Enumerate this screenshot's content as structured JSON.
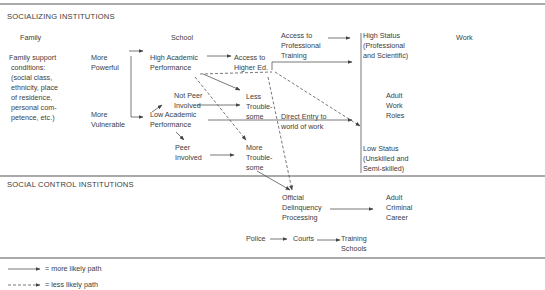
{
  "sections": {
    "socializing": "SOCIALIZING INSTITUTIONS",
    "social_control": "SOCIAL CONTROL INSTITUTIONS"
  },
  "columns": {
    "family": "Family",
    "school": "School",
    "work": "Work"
  },
  "nodes": {
    "family_support": "Family support\n conditions:\n (social class,\n ethnicity, place\n of residence,\n personal com-\n petence, etc.)",
    "more_powerful": "More\nPowerful",
    "more_vulnerable": "More\nVulnerable",
    "high_academic": "High Academic\nPerformance",
    "low_academic": "Low Academic\nPerformance",
    "not_peer_involved": "Not Peer\nInvolved",
    "peer_involved": "Peer\nInvolved",
    "access_higher_ed": "Access to\nHigher Ed.",
    "access_professional": "Access to\nProfessional\nTraining",
    "less_troublesome": "Less\nTrouble-\nsome",
    "more_troublesome": "More\nTrouble-\nsome",
    "direct_entry": "Direct Entry to\nworld of work",
    "high_status": "High Status\n(Professional\nand Scientific)",
    "adult_work_roles": "Adult\nWork\nRoles",
    "low_status": "Low Status\n(Unskilled and\nSemi-skilled)",
    "official_delinquency": "Official\nDelinquency\nProcessing",
    "adult_criminal": "Adult\nCriminal\nCareer",
    "police": "Police",
    "courts": "Courts",
    "training_schools": "Training\nSchools"
  },
  "legend": {
    "solid": "= more likely path",
    "dashed": "= less likely path"
  },
  "colors": {
    "line": "#444444",
    "text": "#3c3c3c",
    "background": "#ffffff"
  }
}
